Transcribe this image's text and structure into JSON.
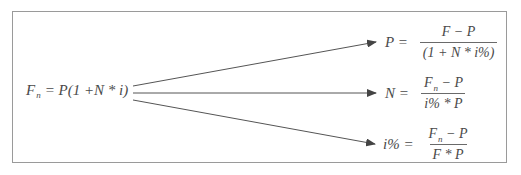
{
  "diagram": {
    "source": {
      "lhs_var": "F",
      "lhs_sub": "n",
      "rhs": "= P(1 +N * i)"
    },
    "targets": [
      {
        "lhs": "P =",
        "numerator": "F − P",
        "denominator": "(1 + N * i%)"
      },
      {
        "lhs": "N =",
        "numerator_var": "F",
        "numerator_sub": "n",
        "numerator_rest": " − P",
        "denominator": "i% * P"
      },
      {
        "lhs": "i% =",
        "numerator_var": "F",
        "numerator_sub": "n",
        "numerator_rest": " − P",
        "denominator": "F * P"
      }
    ],
    "colors": {
      "frame": "#9a9a9a",
      "line": "#555555",
      "text": "#4a4a4a"
    }
  }
}
